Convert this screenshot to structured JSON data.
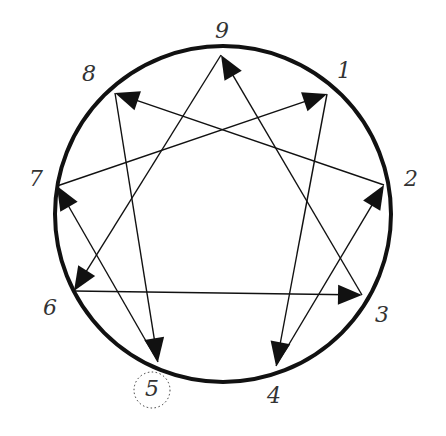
{
  "diagram": {
    "type": "enneagram",
    "circle": {
      "cx": 223,
      "cy": 214,
      "r": 168,
      "stroke": "#111111",
      "stroke_width": 4
    },
    "line_color": "#111111",
    "points": [
      {
        "id": "9",
        "x": 221,
        "y": 55,
        "label": "9",
        "lx": 222,
        "ly": 32
      },
      {
        "id": "1",
        "x": 327,
        "y": 94,
        "label": "1",
        "lx": 344,
        "ly": 72
      },
      {
        "id": "2",
        "x": 384,
        "y": 185,
        "label": "2",
        "lx": 411,
        "ly": 180
      },
      {
        "id": "3",
        "x": 362,
        "y": 295,
        "label": "3",
        "lx": 382,
        "ly": 316
      },
      {
        "id": "4",
        "x": 276,
        "y": 366,
        "label": "4",
        "lx": 274,
        "ly": 397
      },
      {
        "id": "5",
        "x": 158,
        "y": 362,
        "label": "5",
        "lx": 152,
        "ly": 390,
        "highlighted": true
      },
      {
        "id": "6",
        "x": 74,
        "y": 291,
        "label": "6",
        "lx": 50,
        "ly": 309
      },
      {
        "id": "7",
        "x": 57,
        "y": 186,
        "label": "7",
        "lx": 36,
        "ly": 180
      },
      {
        "id": "8",
        "x": 115,
        "y": 93,
        "label": "8",
        "lx": 89,
        "ly": 75
      }
    ],
    "arrows": [
      {
        "from": "9",
        "to": "6"
      },
      {
        "from": "6",
        "to": "3"
      },
      {
        "from": "3",
        "to": "9"
      },
      {
        "from": "1",
        "to": "4"
      },
      {
        "from": "4",
        "to": "2"
      },
      {
        "from": "2",
        "to": "8"
      },
      {
        "from": "8",
        "to": "5"
      },
      {
        "from": "5",
        "to": "7"
      },
      {
        "from": "7",
        "to": "1"
      }
    ],
    "highlight": {
      "point": "5",
      "style": "dotted-circle",
      "r": 18
    }
  }
}
